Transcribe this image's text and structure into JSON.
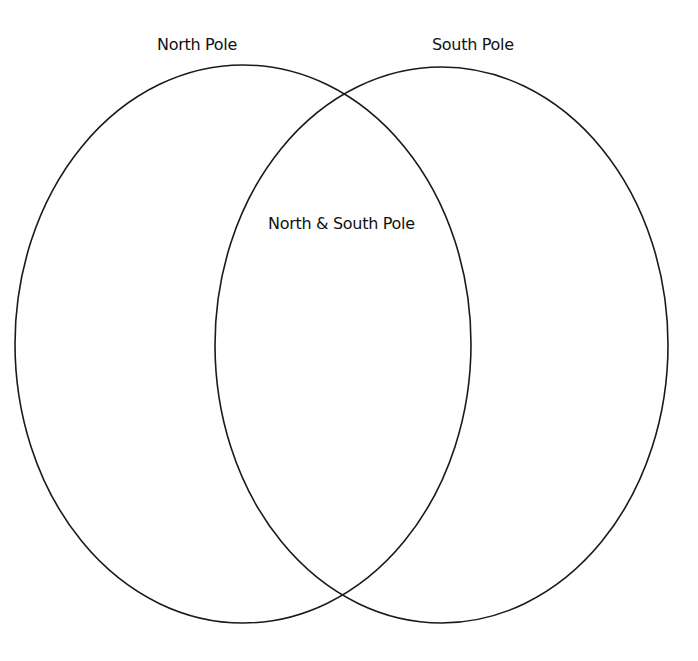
{
  "diagram": {
    "type": "venn",
    "sets": [
      {
        "id": "left",
        "label": "North Pole",
        "cx": 243,
        "cy": 344,
        "rx": 228,
        "ry": 279
      },
      {
        "id": "right",
        "label": "South Pole",
        "cx": 441.5,
        "cy": 345,
        "rx": 226.5,
        "ry": 278
      }
    ],
    "intersection": {
      "label": "North & South Pole"
    },
    "stroke_color": "#1a1a1a",
    "stroke_width": 1.6,
    "background": "#ffffff"
  }
}
